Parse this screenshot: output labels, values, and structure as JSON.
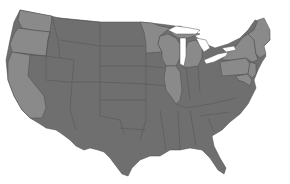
{
  "map": {
    "title": "United States",
    "colors": {
      "background": "#ffffff",
      "group_a": "#6f6f6f",
      "group_b": "#8a8a8a",
      "border": "#4a4a4a",
      "water": "#ffffff"
    },
    "legend": [],
    "highlighted_states": [
      "Washington",
      "Oregon",
      "California",
      "Minnesota",
      "Wisconsin",
      "Illinois",
      "Michigan",
      "New York",
      "Pennsylvania",
      "New Jersey",
      "Maryland",
      "Delaware",
      "Connecticut",
      "Rhode Island",
      "Massachusetts",
      "Vermont",
      "New Hampshire",
      "Maine"
    ],
    "other_states": [
      "Idaho",
      "Montana",
      "Wyoming",
      "Nevada",
      "Utah",
      "Colorado",
      "Arizona",
      "New Mexico",
      "North Dakota",
      "South Dakota",
      "Nebraska",
      "Kansas",
      "Oklahoma",
      "Texas",
      "Iowa",
      "Missouri",
      "Arkansas",
      "Louisiana",
      "Indiana",
      "Ohio",
      "Kentucky",
      "Tennessee",
      "Mississippi",
      "Alabama",
      "Georgia",
      "Florida",
      "South Carolina",
      "North Carolina",
      "Virginia",
      "West Virginia"
    ]
  }
}
